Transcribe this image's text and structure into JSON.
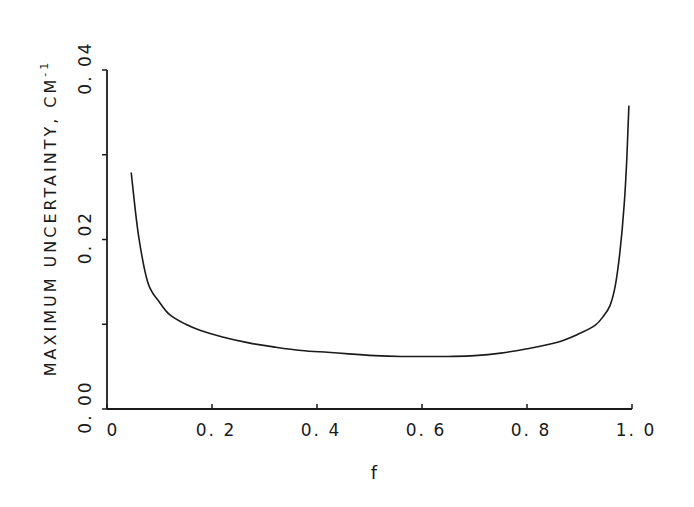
{
  "chart_data": {
    "type": "line",
    "title": "",
    "xlabel": "f",
    "ylabel": "MAXIMUM UNCERTAINTY, CM",
    "ylabel_superscript": "-1",
    "xlim": [
      0,
      1.0
    ],
    "ylim": [
      0.0,
      0.04
    ],
    "grid": false,
    "legend": null,
    "x_ticks": [
      0,
      0.2,
      0.4,
      0.6,
      0.8,
      1.0
    ],
    "x_tick_labels": [
      "0",
      "0. 2",
      "0. 4",
      "0. 6",
      "0. 8",
      "1. 0"
    ],
    "y_ticks": [
      0.0,
      0.01,
      0.02,
      0.03,
      0.04
    ],
    "y_tick_labels": [
      "0. 00",
      "",
      "0. 02",
      "",
      "0. 04"
    ],
    "series": [
      {
        "name": "maximum uncertainty",
        "color": "#1a1a1a",
        "x": [
          0.046,
          0.06,
          0.078,
          0.1,
          0.12,
          0.15,
          0.177,
          0.22,
          0.27,
          0.32,
          0.37,
          0.42,
          0.46,
          0.51,
          0.56,
          0.61,
          0.65,
          0.7,
          0.75,
          0.8,
          0.86,
          0.9,
          0.93,
          0.945,
          0.958,
          0.968,
          0.977,
          0.985,
          0.99,
          0.994
        ],
        "y": [
          0.0279,
          0.0205,
          0.0149,
          0.0126,
          0.0111,
          0.01,
          0.0093,
          0.0085,
          0.0078,
          0.0073,
          0.0069,
          0.0067,
          0.0065,
          0.0063,
          0.0062,
          0.0062,
          0.0062,
          0.0063,
          0.0066,
          0.0071,
          0.0079,
          0.0089,
          0.0099,
          0.0109,
          0.0122,
          0.0145,
          0.0185,
          0.024,
          0.0295,
          0.0358
        ]
      }
    ]
  },
  "labels": {
    "x_title": "f",
    "y_title": "MAXIMUM UNCERTAINTY,  CM",
    "y_title_sup": "-1"
  }
}
